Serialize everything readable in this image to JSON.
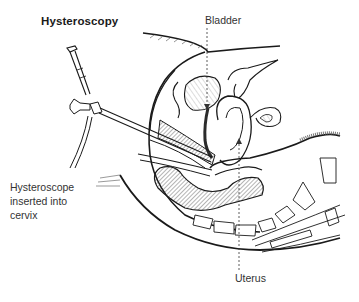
{
  "diagram": {
    "title": "Hysteroscopy",
    "labels": {
      "bladder": "Bladder",
      "uterus": "Uterus",
      "hysteroscope": [
        "Hysteroscope",
        "inserted into",
        "cervix"
      ]
    },
    "colors": {
      "line": "#1a1a1a",
      "hatch": "#555555",
      "dark_fill": "#2b2b2b",
      "background": "#ffffff"
    }
  }
}
